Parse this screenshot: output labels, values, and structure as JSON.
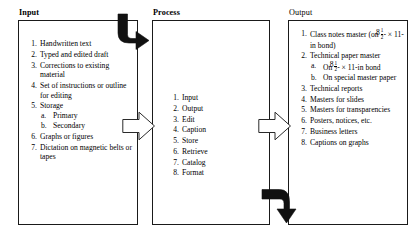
{
  "diagram": {
    "colors": {
      "box_border": "#1a1a1a",
      "solid_arrow": "#111111",
      "hollow_arrow_fill": "#ffffff",
      "hollow_arrow_stroke": "#2a2a2a",
      "background": "#ffffff",
      "text": "#000000"
    },
    "columns": [
      {
        "id": "input",
        "title": "Input",
        "title_bold": true,
        "items": [
          {
            "num": "1.",
            "text": "Handwritten text"
          },
          {
            "num": "2.",
            "text": "Typed and edited draft"
          },
          {
            "num": "3.",
            "text": "Corrections to existing material"
          },
          {
            "num": "4.",
            "text": "Set of  instructions or outline for editing"
          },
          {
            "num": "5.",
            "text": "Storage",
            "sub": [
              {
                "num": "a.",
                "text": "Primary"
              },
              {
                "num": "b.",
                "text": "Secondary"
              }
            ]
          },
          {
            "num": "6.",
            "text": "Graphs  or figures"
          },
          {
            "num": "7.",
            "text": "Dictation on magnetic belts or tapes"
          }
        ]
      },
      {
        "id": "process",
        "title": "Process",
        "title_bold": true,
        "items": [
          {
            "num": "1.",
            "text": "Input"
          },
          {
            "num": "2.",
            "text": "Output"
          },
          {
            "num": "3.",
            "text": "Edit"
          },
          {
            "num": "4.",
            "text": "Caption"
          },
          {
            "num": "5.",
            "text": "Store"
          },
          {
            "num": "6.",
            "text": "Retrieve"
          },
          {
            "num": "7.",
            "text": "Catalog"
          },
          {
            "num": "8.",
            "text": "Format"
          }
        ]
      },
      {
        "id": "output",
        "title": "Output",
        "title_bold": false,
        "items": [
          {
            "num": "1.",
            "text_before": "Class notes master (on ",
            "fraction": {
              "whole": "8",
              "numerator": "1",
              "denominator": "2"
            },
            "text_after": "- × 11-in bond)"
          },
          {
            "num": "2.",
            "text": "Technical paper master",
            "sub": [
              {
                "num": "a.",
                "text_before": "On ",
                "fraction": {
                  "whole": "8",
                  "numerator": "1",
                  "denominator": "2"
                },
                "text_after": "- × 11-in bond"
              },
              {
                "num": "b.",
                "text": "On special master paper"
              }
            ]
          },
          {
            "num": "3.",
            "text": "Technical  reports"
          },
          {
            "num": "4.",
            "text": "Masters for slides"
          },
          {
            "num": "5.",
            "text": "Masters for transparencies"
          },
          {
            "num": "6.",
            "text": "Posters, notices, etc."
          },
          {
            "num": "7.",
            "text": "Business letters"
          },
          {
            "num": "8.",
            "text": "Captions on graphs"
          }
        ]
      }
    ],
    "arrows": [
      {
        "id": "input-to-process-top",
        "style": "solid-black",
        "shape": "down-then-right"
      },
      {
        "id": "input-to-process-mid",
        "style": "hollow-outline",
        "shape": "right"
      },
      {
        "id": "process-to-output-mid",
        "style": "hollow-outline",
        "shape": "right"
      },
      {
        "id": "process-to-output-bottom",
        "style": "solid-black",
        "shape": "right-then-down"
      }
    ]
  }
}
